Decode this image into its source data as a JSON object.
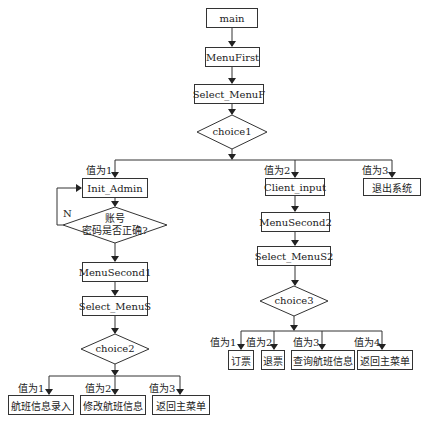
{
  "nodes": {
    "main": "main",
    "menu_first": "MenuFirst",
    "select_menuf": "Select_MenuF",
    "choice1": "choice1",
    "init_admin": "Init_Admin",
    "check_line1": "账号",
    "check_line2": "密码是否正确?",
    "menu_second1": "MenuSecond1",
    "select_menus": "Select_MenuS",
    "choice2": "choice2",
    "flight_entry": "航班信息录入",
    "modify_flight": "修改航班信息",
    "return_main1": "返回主菜单",
    "client_input": "Client_input",
    "exit_system": "退出系统",
    "menu_second2": "MenuSecond2",
    "select_menus2": "Select_MenuS2",
    "choice3": "choice3",
    "book_ticket": "订票",
    "refund_ticket": "退票",
    "query_flight": "查询航班信息",
    "return_main2": "返回主菜单"
  },
  "labels": {
    "c1_v1": "值为1",
    "c1_v2": "值为2",
    "c1_v3": "值为3",
    "no": "N",
    "c2_v1": "值为1",
    "c2_v2": "值为2",
    "c2_v3": "值为3",
    "c3_v1": "值为1",
    "c3_v2": "值为2",
    "c3_v3": "值为3",
    "c3_v4": "值为4"
  }
}
